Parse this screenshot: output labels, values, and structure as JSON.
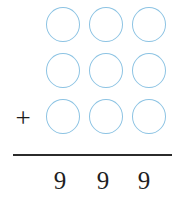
{
  "problem": {
    "type": "vertical-addition-worksheet",
    "operator": "+",
    "rows": [
      {
        "label": "addend-row-1",
        "cells": [
          {
            "name": "answer-bubble",
            "value": ""
          },
          {
            "name": "answer-bubble",
            "value": ""
          },
          {
            "name": "answer-bubble",
            "value": ""
          }
        ]
      },
      {
        "label": "addend-row-2",
        "cells": [
          {
            "name": "answer-bubble",
            "value": ""
          },
          {
            "name": "answer-bubble",
            "value": ""
          },
          {
            "name": "answer-bubble",
            "value": ""
          }
        ]
      },
      {
        "label": "addend-row-3",
        "cells": [
          {
            "name": "answer-bubble",
            "value": ""
          },
          {
            "name": "answer-bubble",
            "value": ""
          },
          {
            "name": "answer-bubble",
            "value": ""
          }
        ]
      }
    ],
    "sum_digits": [
      "9",
      "9",
      "9"
    ]
  },
  "colors": {
    "bubble_stroke": "#8cc3e3",
    "rule": "#2b2b2b",
    "digit": "#1f1f1f",
    "operator": "#1c1c1c",
    "background": "#ffffff"
  }
}
